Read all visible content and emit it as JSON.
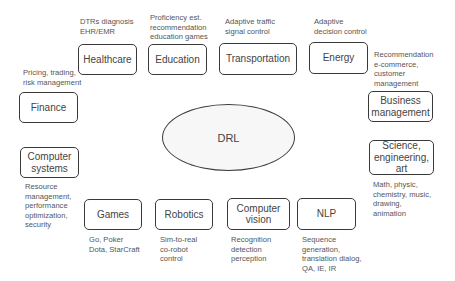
{
  "center": {
    "label": "DRL"
  },
  "domains": [
    {
      "id": "healthcare",
      "label": "Healthcare",
      "apps": "DTRs diagnosis\nEHR/EMR"
    },
    {
      "id": "education",
      "label": "Education",
      "apps": "Proficiency est.\nrecommendation\neducation games"
    },
    {
      "id": "transportation",
      "label": "Transportation",
      "apps": "Adaptive traffic\nsignal control"
    },
    {
      "id": "energy",
      "label": "Energy",
      "apps": "Adaptive\ndecision control"
    },
    {
      "id": "business",
      "label": "Business\nmanagement",
      "apps": "Recommendation\ne-commerce,\ncustomer\nmanagement"
    },
    {
      "id": "science",
      "label": "Science,\nengineering,\nart",
      "apps": "Math, physic,\nchemistry, music,\ndrawing,\nanimation"
    },
    {
      "id": "finance",
      "label": "Finance",
      "apps": "Pricing, trading,\nrisk management"
    },
    {
      "id": "computer-systems",
      "label": "Computer\nsystems",
      "apps": "Resource\nmanagement,\nperformance\noptimization,\nsecurity"
    },
    {
      "id": "games",
      "label": "Games",
      "apps": "Go, Poker\nDota, StarCraft"
    },
    {
      "id": "robotics",
      "label": "Robotics",
      "apps": "Sim-to-real\nco-robot\ncontrol"
    },
    {
      "id": "computer-vision",
      "label": "Computer\nvision",
      "apps": "Recognition\ndetection\nperception"
    },
    {
      "id": "nlp",
      "label": "NLP",
      "apps": "Sequence\ngeneration,\ntranslation dialog,\nQA, IE, IR"
    }
  ]
}
